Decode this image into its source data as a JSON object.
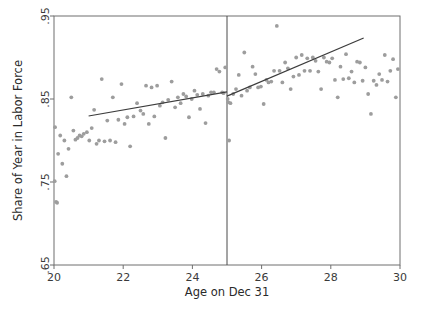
{
  "chart_data": {
    "type": "scatter",
    "title": "",
    "xlabel": "Age on Dec 31",
    "ylabel": "Share of Year in Labor Force",
    "xlim": [
      20,
      30
    ],
    "ylim": [
      0.65,
      0.95
    ],
    "xticks": [
      20,
      22,
      24,
      26,
      28,
      30
    ],
    "xtick_labels": [
      "20",
      "22",
      "24",
      "26",
      "28",
      "30"
    ],
    "yticks": [
      0.65,
      0.75,
      0.85,
      0.95
    ],
    "ytick_labels": [
      ".65",
      ".75",
      ".85",
      ".95"
    ],
    "grid": false,
    "legend": null,
    "point_color": "#9d9d9d",
    "line_color": "#3c3c3c",
    "frame_color": "#6f6f6f",
    "annotations": [
      {
        "name": "cutoff-line",
        "type": "vline",
        "x": 25,
        "label": ""
      }
    ],
    "series": [
      {
        "name": "binned-means-left",
        "type": "scatter",
        "points": [
          [
            20.02,
            0.751
          ],
          [
            20.03,
            0.816
          ],
          [
            20.06,
            0.726
          ],
          [
            20.09,
            0.725
          ],
          [
            20.12,
            0.784
          ],
          [
            20.18,
            0.806
          ],
          [
            20.24,
            0.772
          ],
          [
            20.3,
            0.8
          ],
          [
            20.36,
            0.757
          ],
          [
            20.42,
            0.79
          ],
          [
            20.5,
            0.852
          ],
          [
            20.56,
            0.812
          ],
          [
            20.62,
            0.801
          ],
          [
            20.68,
            0.803
          ],
          [
            20.74,
            0.806
          ],
          [
            20.8,
            0.805
          ],
          [
            20.86,
            0.808
          ],
          [
            20.95,
            0.81
          ],
          [
            21.02,
            0.8
          ],
          [
            21.09,
            0.815
          ],
          [
            21.16,
            0.837
          ],
          [
            21.23,
            0.796
          ],
          [
            21.3,
            0.8
          ],
          [
            21.38,
            0.874
          ],
          [
            21.46,
            0.799
          ],
          [
            21.54,
            0.824
          ],
          [
            21.62,
            0.8
          ],
          [
            21.7,
            0.852
          ],
          [
            21.78,
            0.798
          ],
          [
            21.86,
            0.825
          ],
          [
            21.95,
            0.868
          ],
          [
            22.04,
            0.82
          ],
          [
            22.12,
            0.828
          ],
          [
            22.2,
            0.793
          ],
          [
            22.3,
            0.829
          ],
          [
            22.4,
            0.845
          ],
          [
            22.5,
            0.836
          ],
          [
            22.58,
            0.832
          ],
          [
            22.66,
            0.866
          ],
          [
            22.74,
            0.82
          ],
          [
            22.82,
            0.864
          ],
          [
            22.9,
            0.829
          ],
          [
            22.98,
            0.866
          ],
          [
            23.06,
            0.842
          ],
          [
            23.14,
            0.846
          ],
          [
            23.22,
            0.803
          ],
          [
            23.3,
            0.849
          ],
          [
            23.4,
            0.871
          ],
          [
            23.5,
            0.84
          ],
          [
            23.58,
            0.852
          ],
          [
            23.66,
            0.845
          ],
          [
            23.74,
            0.856
          ],
          [
            23.82,
            0.853
          ],
          [
            23.9,
            0.828
          ],
          [
            23.98,
            0.85
          ],
          [
            24.06,
            0.86
          ],
          [
            24.14,
            0.855
          ],
          [
            24.22,
            0.838
          ],
          [
            24.3,
            0.856
          ],
          [
            24.38,
            0.821
          ],
          [
            24.46,
            0.854
          ],
          [
            24.54,
            0.858
          ],
          [
            24.62,
            0.858
          ],
          [
            24.7,
            0.886
          ],
          [
            24.78,
            0.883
          ],
          [
            24.86,
            0.858
          ],
          [
            24.9,
            0.857
          ],
          [
            24.95,
            0.888
          ]
        ]
      },
      {
        "name": "binned-means-right",
        "type": "scatter",
        "points": [
          [
            25.02,
            0.85
          ],
          [
            25.04,
            0.846
          ],
          [
            25.06,
            0.8
          ],
          [
            25.1,
            0.845
          ],
          [
            25.18,
            0.856
          ],
          [
            25.26,
            0.862
          ],
          [
            25.34,
            0.879
          ],
          [
            25.42,
            0.854
          ],
          [
            25.5,
            0.906
          ],
          [
            25.58,
            0.86
          ],
          [
            25.66,
            0.864
          ],
          [
            25.74,
            0.889
          ],
          [
            25.82,
            0.88
          ],
          [
            25.9,
            0.864
          ],
          [
            25.98,
            0.865
          ],
          [
            26.06,
            0.844
          ],
          [
            26.14,
            0.873
          ],
          [
            26.2,
            0.87
          ],
          [
            26.28,
            0.871
          ],
          [
            26.36,
            0.884
          ],
          [
            26.44,
            0.938
          ],
          [
            26.52,
            0.884
          ],
          [
            26.6,
            0.87
          ],
          [
            26.68,
            0.894
          ],
          [
            26.76,
            0.887
          ],
          [
            26.84,
            0.862
          ],
          [
            26.92,
            0.877
          ],
          [
            27.0,
            0.9
          ],
          [
            27.08,
            0.879
          ],
          [
            27.16,
            0.903
          ],
          [
            27.24,
            0.884
          ],
          [
            27.32,
            0.899
          ],
          [
            27.4,
            0.884
          ],
          [
            27.48,
            0.9
          ],
          [
            27.56,
            0.896
          ],
          [
            27.64,
            0.883
          ],
          [
            27.72,
            0.862
          ],
          [
            27.8,
            0.9
          ],
          [
            27.88,
            0.895
          ],
          [
            27.96,
            0.894
          ],
          [
            28.04,
            0.899
          ],
          [
            28.12,
            0.873
          ],
          [
            28.2,
            0.852
          ],
          [
            28.28,
            0.889
          ],
          [
            28.36,
            0.874
          ],
          [
            28.44,
            0.904
          ],
          [
            28.52,
            0.875
          ],
          [
            28.6,
            0.883
          ],
          [
            28.68,
            0.87
          ],
          [
            28.76,
            0.895
          ],
          [
            28.84,
            0.894
          ],
          [
            28.92,
            0.872
          ],
          [
            29.0,
            0.888
          ],
          [
            29.08,
            0.856
          ],
          [
            29.16,
            0.832
          ],
          [
            29.24,
            0.872
          ],
          [
            29.32,
            0.867
          ],
          [
            29.4,
            0.88
          ],
          [
            29.48,
            0.873
          ],
          [
            29.56,
            0.903
          ],
          [
            29.64,
            0.871
          ],
          [
            29.72,
            0.884
          ],
          [
            29.8,
            0.898
          ],
          [
            29.88,
            0.852
          ],
          [
            29.94,
            0.886
          ]
        ]
      }
    ],
    "fits": [
      {
        "name": "fit-left",
        "type": "line",
        "x_start": 21.0,
        "y_start": 0.8295,
        "x_end": 25.0,
        "y_end": 0.8585
      },
      {
        "name": "fit-right",
        "type": "line",
        "x_start": 25.0,
        "y_start": 0.8535,
        "x_end": 28.95,
        "y_end": 0.9235
      }
    ]
  }
}
